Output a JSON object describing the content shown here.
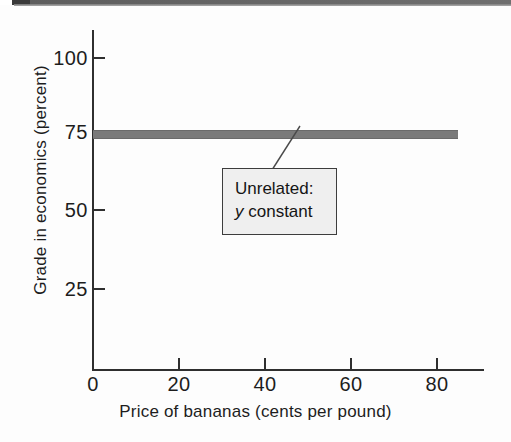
{
  "chart_data": {
    "type": "line",
    "title": "",
    "subtitle": "",
    "xlabel": "Price of bananas (cents per pound)",
    "ylabel": "Grade in economics (percent)",
    "xlim": [
      0,
      92
    ],
    "ylim": [
      0,
      108
    ],
    "xticks": [
      0,
      20,
      40,
      60,
      80
    ],
    "xticklabels": [
      "0",
      "20",
      "40",
      "60",
      "80"
    ],
    "yticks": [
      25,
      50,
      75,
      100
    ],
    "yticklabels": [
      "25",
      "50",
      "75",
      "100"
    ],
    "grid": false,
    "legend": null,
    "series": [
      {
        "name": "Grade in economics",
        "x": [
          0,
          20,
          40,
          60,
          80,
          86
        ],
        "values": [
          75,
          75,
          75,
          75,
          75,
          75
        ],
        "color": "#7a7a7a",
        "linewidth": 7
      }
    ],
    "annotations": [
      {
        "name": "unrelated-callout",
        "line1": "Unrelated:",
        "line2_var": "y",
        "line2_rest": " constant",
        "x": 33,
        "y": 52,
        "points_to_x": 42,
        "points_to_y": 75
      }
    ]
  },
  "axes": {
    "y_title": "Grade in economics (percent)",
    "x_title": "Price of bananas (cents per pound)",
    "y_tick_labels": [
      "100",
      "75",
      "50",
      "25"
    ],
    "x_tick_labels": [
      "0",
      "20",
      "40",
      "60",
      "80"
    ]
  },
  "callout": {
    "line1": "Unrelated:",
    "line2_var": "y",
    "line2_rest": " constant"
  },
  "colors": {
    "series": "#7a7a7a",
    "axis": "#2f2f2f",
    "text": "#1d1d1d",
    "callout_bg": "#efefef",
    "callout_border": "#3d3d3d"
  }
}
